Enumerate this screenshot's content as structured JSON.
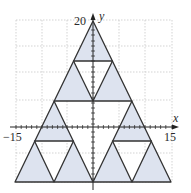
{
  "figure": {
    "type": "sierpinski-triangle-stage-2",
    "axes": {
      "x_label": "x",
      "y_label": "y",
      "x_min_tick": "−15",
      "x_max_tick": "15",
      "y_max_tick": "20",
      "grid_spacing": 5
    },
    "outer_triangle": {
      "vertices": [
        [
          -15,
          -10.5
        ],
        [
          15,
          -10.5
        ],
        [
          0,
          20
        ]
      ]
    },
    "colors": {
      "fill_shaded": "#dde3ef",
      "stroke": "#333333",
      "grid": "#c8c8c8",
      "axis": "#222222",
      "background": "#ffffff"
    }
  }
}
